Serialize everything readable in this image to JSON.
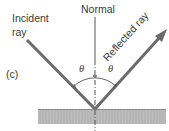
{
  "diagram": {
    "panel_label": "(c)",
    "incident_label_line1": "Incident",
    "incident_label_line2": "ray",
    "normal_label": "Normal",
    "reflected_label": "Reflected ray",
    "angle_left": "θ",
    "angle_right": "θ",
    "colors": {
      "ray": "#6b6b6b",
      "text": "#3a3a3a",
      "surface_fill": "#b9b9b9",
      "surface_edge": "#8a8a8a",
      "normal_line": "#555555"
    }
  }
}
